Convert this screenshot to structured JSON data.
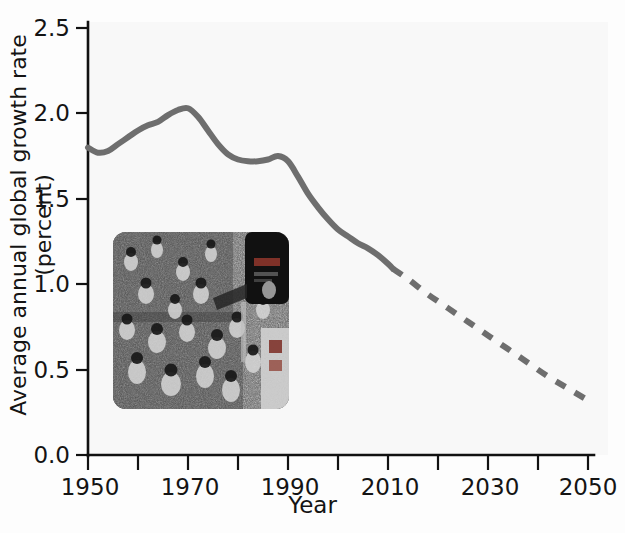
{
  "figure": {
    "name": "average-annual-global-growth-rate",
    "background_color": "#fdfdfd",
    "plot_background_color": "#f8f8f8"
  },
  "chart_data": {
    "type": "line",
    "title": "",
    "subtitle": "",
    "xlabel": "Year",
    "ylabel": "Average annual global growth rate (percent)",
    "xlim": [
      1950,
      2050
    ],
    "ylim": [
      0.0,
      2.5
    ],
    "xticks": [
      1950,
      1960,
      1970,
      1980,
      1990,
      2000,
      2010,
      2020,
      2030,
      2040,
      2050
    ],
    "xtick_labels": [
      "1950",
      "",
      "1970",
      "",
      "1990",
      "",
      "2010",
      "",
      "2030",
      "",
      "2050"
    ],
    "xtick_labels_shown": [
      "1950",
      "1970",
      "1990",
      "2010",
      "2030",
      "2050"
    ],
    "yticks": [
      0.0,
      0.5,
      1.0,
      1.5,
      2.0,
      2.5
    ],
    "ytick_labels": [
      "0.0",
      "0.5",
      "1.0",
      "1.5",
      "2.0",
      "2.5"
    ],
    "grid": false,
    "legend": null,
    "legend_position": "none",
    "line_color": "#6e6e6e",
    "line_width_px": 6,
    "series": [
      {
        "name": "Estimated (historical)",
        "style": "solid",
        "color": "#6e6e6e",
        "x": [
          1950,
          1952,
          1954,
          1956,
          1958,
          1960,
          1962,
          1964,
          1966,
          1968,
          1970,
          1972,
          1974,
          1976,
          1978,
          1980,
          1982,
          1984,
          1986,
          1988,
          1990,
          1992,
          1994,
          1996,
          1998,
          2000,
          2002,
          2004,
          2006,
          2008,
          2010,
          2011
        ],
        "y": [
          1.8,
          1.77,
          1.78,
          1.82,
          1.86,
          1.9,
          1.93,
          1.95,
          1.99,
          2.02,
          2.03,
          1.98,
          1.9,
          1.82,
          1.76,
          1.73,
          1.72,
          1.72,
          1.73,
          1.75,
          1.72,
          1.63,
          1.53,
          1.45,
          1.38,
          1.32,
          1.28,
          1.24,
          1.21,
          1.17,
          1.12,
          1.09
        ]
      },
      {
        "name": "Projected",
        "style": "dashed",
        "color": "#6e6e6e",
        "x": [
          2011,
          2014,
          2018,
          2022,
          2026,
          2030,
          2034,
          2038,
          2042,
          2046,
          2050
        ],
        "y": [
          1.09,
          1.03,
          0.94,
          0.86,
          0.78,
          0.7,
          0.62,
          0.54,
          0.46,
          0.39,
          0.32
        ]
      }
    ],
    "annotations": [
      {
        "type": "inset-image",
        "name": "crowd-photograph",
        "description": "Black-and-white photograph of a dense crowd of people in a street with a tall dark billboard sign at the right",
        "data_x_range": [
          1955,
          1990
        ],
        "data_y_range": [
          0.27,
          1.3
        ]
      }
    ]
  },
  "axes": {
    "y_title": "Average annual global growth rate (percent)",
    "x_title": "Year",
    "y_labels": [
      "2.5",
      "2.0",
      "1.5",
      "1.0",
      "0.5",
      "0.0"
    ],
    "x_labels": [
      "1950",
      "1970",
      "1990",
      "2010",
      "2030",
      "2050"
    ]
  }
}
